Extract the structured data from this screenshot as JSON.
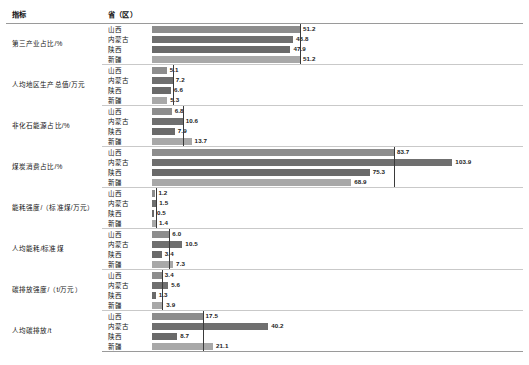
{
  "table": {
    "headers": {
      "indicator": "指标",
      "province": "省（区）",
      "chart": ""
    },
    "axis_max": 110,
    "colors": {
      "bar_shanxi": "#8d8d8d",
      "bar_neimenggu": "#6f6f6f",
      "bar_shaanxi": "#6a6a6a",
      "bar_xinjiang": "#a8a8a8",
      "reference_line": "#3a3a3a",
      "rule": "#9a9a9a"
    },
    "groups": [
      {
        "indicator": "第三产业占比/%",
        "reference_value": 51.2,
        "rows": [
          {
            "province": "山西",
            "value": 51.2,
            "label": "51.2"
          },
          {
            "province": "内蒙古",
            "value": 48.8,
            "label": "48.8"
          },
          {
            "province": "陕西",
            "value": 47.9,
            "label": "47.9"
          },
          {
            "province": "新疆",
            "value": 51.2,
            "label": "51.2"
          }
        ]
      },
      {
        "indicator": "人均地区生产总值/万元",
        "reference_value": 7.2,
        "rows": [
          {
            "province": "山西",
            "value": 5.1,
            "label": "5.1"
          },
          {
            "province": "内蒙古",
            "value": 7.2,
            "label": "7.2"
          },
          {
            "province": "陕西",
            "value": 6.6,
            "label": "6.6"
          },
          {
            "province": "新疆",
            "value": 5.3,
            "label": "5.3"
          }
        ]
      },
      {
        "indicator": "非化石能源占比/%",
        "reference_value": 10.6,
        "rows": [
          {
            "province": "山西",
            "value": 6.8,
            "label": "6.8"
          },
          {
            "province": "内蒙古",
            "value": 10.6,
            "label": "10.6"
          },
          {
            "province": "陕西",
            "value": 7.9,
            "label": "7.9"
          },
          {
            "province": "新疆",
            "value": 13.7,
            "label": "13.7"
          }
        ]
      },
      {
        "indicator": "煤炭消费占比/%",
        "reference_value": 83.7,
        "rows": [
          {
            "province": "山西",
            "value": 83.7,
            "label": "83.7"
          },
          {
            "province": "内蒙古",
            "value": 103.9,
            "label": "103.9"
          },
          {
            "province": "陕西",
            "value": 75.3,
            "label": "75.3"
          },
          {
            "province": "新疆",
            "value": 68.9,
            "label": "68.9"
          }
        ]
      },
      {
        "indicator": "能耗强度/（标准煤/万元）",
        "reference_value": 1.5,
        "rows": [
          {
            "province": "山西",
            "value": 1.2,
            "label": "1.2"
          },
          {
            "province": "内蒙古",
            "value": 1.5,
            "label": "1.5"
          },
          {
            "province": "陕西",
            "value": 0.5,
            "label": "0.5"
          },
          {
            "province": "新疆",
            "value": 1.4,
            "label": "1.4"
          }
        ]
      },
      {
        "indicator": "人均能耗/标准煤",
        "reference_value": 6.0,
        "rows": [
          {
            "province": "山西",
            "value": 6.0,
            "label": "6.0"
          },
          {
            "province": "内蒙古",
            "value": 10.5,
            "label": "10.5"
          },
          {
            "province": "陕西",
            "value": 3.4,
            "label": "3.4"
          },
          {
            "province": "新疆",
            "value": 7.3,
            "label": "7.3"
          }
        ]
      },
      {
        "indicator": "碳排放强度/（t/万元）",
        "reference_value": 3.4,
        "rows": [
          {
            "province": "山西",
            "value": 3.4,
            "label": "3.4"
          },
          {
            "province": "内蒙古",
            "value": 5.6,
            "label": "5.6"
          },
          {
            "province": "陕西",
            "value": 1.3,
            "label": "1.3"
          },
          {
            "province": "新疆",
            "value": 3.9,
            "label": "3.9"
          }
        ]
      },
      {
        "indicator": "人均碳排放/t",
        "reference_value": 17.5,
        "rows": [
          {
            "province": "山西",
            "value": 17.5,
            "label": "17.5"
          },
          {
            "province": "内蒙古",
            "value": 40.2,
            "label": "40.2"
          },
          {
            "province": "陕西",
            "value": 8.7,
            "label": "8.7"
          },
          {
            "province": "新疆",
            "value": 21.1,
            "label": "21.1"
          }
        ]
      }
    ]
  },
  "chart_data": {
    "type": "bar",
    "title": "",
    "xlabel": "",
    "ylabel": "",
    "orientation": "horizontal",
    "grid": false,
    "legend_position": "none",
    "categories": [
      "山西",
      "内蒙古",
      "陕西",
      "新疆"
    ],
    "panels": [
      {
        "indicator": "第三产业占比/%",
        "values": [
          51.2,
          48.8,
          47.9,
          51.2
        ],
        "reference_value": 51.2,
        "xlim": [
          0,
          110
        ]
      },
      {
        "indicator": "人均地区生产总值/万元",
        "values": [
          5.1,
          7.2,
          6.6,
          5.3
        ],
        "reference_value": 7.2,
        "xlim": [
          0,
          110
        ]
      },
      {
        "indicator": "非化石能源占比/%",
        "values": [
          6.8,
          10.6,
          7.9,
          13.7
        ],
        "reference_value": 10.6,
        "xlim": [
          0,
          110
        ]
      },
      {
        "indicator": "煤炭消费占比/%",
        "values": [
          83.7,
          103.9,
          75.3,
          68.9
        ],
        "reference_value": 83.7,
        "xlim": [
          0,
          110
        ]
      },
      {
        "indicator": "能耗强度/（标准煤/万元）",
        "values": [
          1.2,
          1.5,
          0.5,
          1.4
        ],
        "reference_value": 1.5,
        "xlim": [
          0,
          110
        ]
      },
      {
        "indicator": "人均能耗/标准煤",
        "values": [
          6.0,
          10.5,
          3.4,
          7.3
        ],
        "reference_value": 6.0,
        "xlim": [
          0,
          110
        ]
      },
      {
        "indicator": "碳排放强度/（t/万元）",
        "values": [
          3.4,
          5.6,
          1.3,
          3.9
        ],
        "reference_value": 3.4,
        "xlim": [
          0,
          110
        ]
      },
      {
        "indicator": "人均碳排放/t",
        "values": [
          17.5,
          40.2,
          8.7,
          21.1
        ],
        "reference_value": 17.5,
        "xlim": [
          0,
          110
        ]
      }
    ]
  }
}
